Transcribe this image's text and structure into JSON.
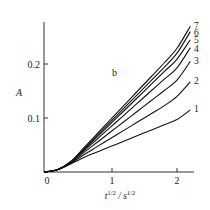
{
  "chart_data": {
    "type": "line",
    "title": "",
    "panel_label": "b",
    "xlabel": "t^1/2 / s^1/2",
    "ylabel": "A",
    "xlim": [
      0,
      2.3
    ],
    "ylim": [
      0,
      0.28
    ],
    "x_ticks": [
      0,
      1,
      2
    ],
    "x_tick_labels": [
      "0",
      "1",
      "2"
    ],
    "y_ticks": [
      0.1,
      0.2
    ],
    "y_tick_labels": [
      "0.1",
      "0.2"
    ],
    "grid": false,
    "legend": "inline labels at curve ends",
    "x": [
      0,
      0.2,
      0.4,
      0.6,
      0.8,
      1.0,
      1.2,
      1.4,
      1.6,
      1.8,
      2.0,
      2.2
    ],
    "series": [
      {
        "name": "1",
        "values": [
          0,
          0.004,
          0.015,
          0.027,
          0.037,
          0.047,
          0.057,
          0.067,
          0.077,
          0.087,
          0.097,
          0.115
        ]
      },
      {
        "name": "2",
        "values": [
          0,
          0.004,
          0.016,
          0.032,
          0.047,
          0.062,
          0.077,
          0.092,
          0.107,
          0.122,
          0.14,
          0.167
        ]
      },
      {
        "name": "3",
        "values": [
          0,
          0.004,
          0.017,
          0.036,
          0.055,
          0.074,
          0.093,
          0.112,
          0.131,
          0.15,
          0.17,
          0.205
        ]
      },
      {
        "name": "4",
        "values": [
          0,
          0.004,
          0.018,
          0.039,
          0.061,
          0.083,
          0.105,
          0.127,
          0.149,
          0.171,
          0.193,
          0.23
        ]
      },
      {
        "name": "5",
        "values": [
          0,
          0.004,
          0.018,
          0.041,
          0.065,
          0.089,
          0.113,
          0.137,
          0.161,
          0.185,
          0.209,
          0.245
        ]
      },
      {
        "name": "6",
        "values": [
          0,
          0.004,
          0.019,
          0.043,
          0.068,
          0.093,
          0.118,
          0.143,
          0.168,
          0.193,
          0.22,
          0.26
        ]
      },
      {
        "name": "7",
        "values": [
          0,
          0.004,
          0.019,
          0.045,
          0.071,
          0.097,
          0.123,
          0.149,
          0.175,
          0.201,
          0.229,
          0.27
        ]
      }
    ]
  },
  "labels": {
    "ylabel": "A",
    "panel": "b",
    "x_unit_t": "t",
    "x_unit_sep": " / s",
    "x_exp": "1/2",
    "origin": "0",
    "xtick1": "1",
    "xtick2": "2",
    "ytick1": "0.1",
    "ytick2": "0.2",
    "curve1": "1",
    "curve2": "2",
    "curve3": "3",
    "curve4": "4",
    "curve5": "5",
    "curve6": "6",
    "curve7": "7"
  }
}
